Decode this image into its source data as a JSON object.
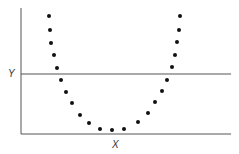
{
  "chart_data": {
    "type": "scatter",
    "title": "",
    "xlabel": "X",
    "ylabel": "Y",
    "grid": false,
    "legend": null,
    "reference_line": {
      "orientation": "horizontal",
      "label": "Y"
    },
    "points_px": [
      [
        49,
        16
      ],
      [
        50,
        30
      ],
      [
        51,
        43
      ],
      [
        54,
        55
      ],
      [
        57,
        68
      ],
      [
        61,
        80
      ],
      [
        66,
        92
      ],
      [
        72,
        103
      ],
      [
        80,
        115
      ],
      [
        89,
        123
      ],
      [
        100,
        129
      ],
      [
        112,
        130
      ],
      [
        124,
        129
      ],
      [
        138,
        122
      ],
      [
        148,
        113
      ],
      [
        155,
        102
      ],
      [
        162,
        91
      ],
      [
        167,
        80
      ],
      [
        172,
        67
      ],
      [
        175,
        55
      ],
      [
        177,
        42
      ],
      [
        179,
        30
      ],
      [
        180,
        16
      ]
    ],
    "colors": {
      "axis": "#555555",
      "dot": "#111111"
    }
  },
  "labels": {
    "x": "X",
    "y": "Y"
  }
}
